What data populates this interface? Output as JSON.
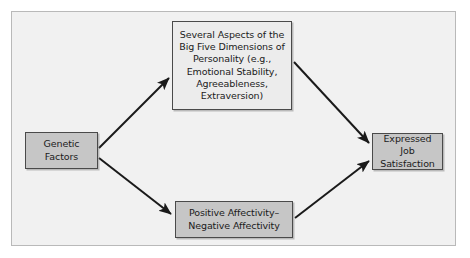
{
  "figure": {
    "type": "path-diagram",
    "orientation": "left-to-right",
    "frame": {
      "background_color": "#f1f1f1",
      "border_color": "#b9b9b9"
    },
    "arrow_color": "#1a1a1a"
  },
  "nodes": {
    "genetic": {
      "id": "genetic-factors",
      "label": "Genetic\nFactors",
      "line1": "Genetic",
      "line2": "Factors",
      "fill_color": "#c6c6c6",
      "border_color": "#4a4a4a"
    },
    "bigfive": {
      "id": "big-five-dimensions",
      "line1": "Several Aspects of the",
      "line2": "Big Five Dimensions of",
      "line3": "Personality (e.g.,",
      "line4": "Emotional Stability,",
      "line5": "Agreeableness,",
      "line6": "Extraversion)",
      "fill_color": "#ececec",
      "border_color": "#4a4a4a"
    },
    "affectivity": {
      "id": "positive-negative-affectivity",
      "line1": "Positive Affectivity–",
      "line2": "Negative Affectivity",
      "fill_color": "#c6c6c6",
      "border_color": "#4a4a4a"
    },
    "satisfaction": {
      "id": "expressed-job-satisfaction",
      "line1": "Expressed Job",
      "line2": "Satisfaction",
      "fill_color": "#c6c6c6",
      "border_color": "#4a4a4a"
    }
  },
  "edges": [
    {
      "id": "genetic-to-bigfive",
      "from": "genetic-factors",
      "to": "big-five-dimensions",
      "label": ""
    },
    {
      "id": "genetic-to-affectivity",
      "from": "genetic-factors",
      "to": "positive-negative-affectivity",
      "label": ""
    },
    {
      "id": "bigfive-to-satisfaction",
      "from": "big-five-dimensions",
      "to": "expressed-job-satisfaction",
      "label": ""
    },
    {
      "id": "affectivity-to-satisfaction",
      "from": "positive-negative-affectivity",
      "to": "expressed-job-satisfaction",
      "label": ""
    }
  ]
}
